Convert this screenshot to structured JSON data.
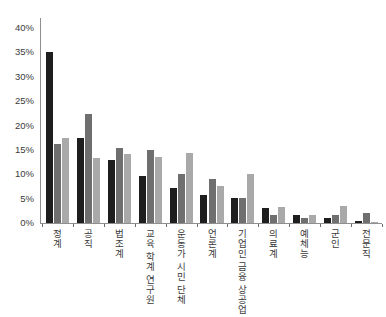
{
  "chart_data": {
    "type": "bar",
    "title": "",
    "xlabel": "",
    "ylabel": "",
    "categories": [
      "정계",
      "공직",
      "법조계",
      "교육 학계 연구원",
      "운동가 시민 단체",
      "언론계",
      "기업인 금융 상공업",
      "의료계",
      "예체능",
      "군인",
      "전문직"
    ],
    "series": [
      {
        "name": "black-bars",
        "color": "#1e1e1e",
        "values": [
          35.0,
          17.4,
          13.0,
          9.6,
          7.2,
          5.7,
          5.2,
          3.0,
          1.6,
          1.1,
          0.4
        ]
      },
      {
        "name": "dark-gray-bars",
        "color": "#6f6f6f",
        "values": [
          16.2,
          22.4,
          15.3,
          14.9,
          10.0,
          9.0,
          5.2,
          1.6,
          1.0,
          1.6,
          2.0
        ]
      },
      {
        "name": "light-gray-bars",
        "color": "#a9a9a9",
        "values": [
          17.5,
          13.3,
          14.1,
          13.6,
          14.3,
          7.6,
          10.0,
          3.3,
          1.6,
          3.5,
          0.3
        ]
      }
    ],
    "ylim": [
      0,
      40
    ],
    "ytick_step": 5,
    "ytick_labels": [
      "0%",
      "5%",
      "10%",
      "15%",
      "20%",
      "25%",
      "30%",
      "35%",
      "40%"
    ],
    "grid": false,
    "legend": "none",
    "background_color": "#ffffff",
    "axis_color": "#8f8f8f",
    "text_color": "#3b3b3b"
  }
}
